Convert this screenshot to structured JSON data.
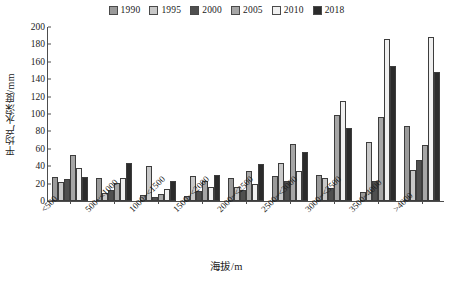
{
  "chart_data": {
    "type": "bar",
    "title": "",
    "xlabel": "海拔/m",
    "ylabel": "平均产水深度/mm",
    "ylim": [
      0,
      200
    ],
    "ytick_step": 20,
    "yticks": [
      200,
      180,
      160,
      140,
      120,
      100,
      80,
      60,
      40,
      20,
      0
    ],
    "grid": false,
    "legend_position": "top-center",
    "categories": [
      "<500",
      "500~<1000",
      "1000~<1500",
      "1500~<2000",
      "2000~<2500",
      "2500~<3000",
      "3000~<3500",
      "3500~4000",
      ">4000"
    ],
    "series": [
      {
        "name": "1990",
        "color": "#9a9a9a",
        "values": [
          28,
          27,
          7,
          6,
          27,
          29,
          30,
          10,
          86
        ]
      },
      {
        "name": "1995",
        "color": "#c8c8c8",
        "values": [
          22,
          9,
          40,
          29,
          16,
          44,
          27,
          68,
          36
        ]
      },
      {
        "name": "2000",
        "color": "#4f4f4f",
        "values": [
          25,
          13,
          5,
          12,
          13,
          23,
          15,
          23,
          47
        ]
      },
      {
        "name": "2005",
        "color": "#a6a6a6",
        "values": [
          53,
          21,
          8,
          23,
          34,
          66,
          99,
          96,
          64
        ]
      },
      {
        "name": "2010",
        "color": "#f0f0f0",
        "values": [
          38,
          27,
          14,
          16,
          20,
          34,
          115,
          186,
          188
        ]
      },
      {
        "name": "2018",
        "color": "#2b2b2b",
        "values": [
          28,
          44,
          23,
          30,
          43,
          56,
          84,
          155,
          148
        ]
      }
    ]
  }
}
